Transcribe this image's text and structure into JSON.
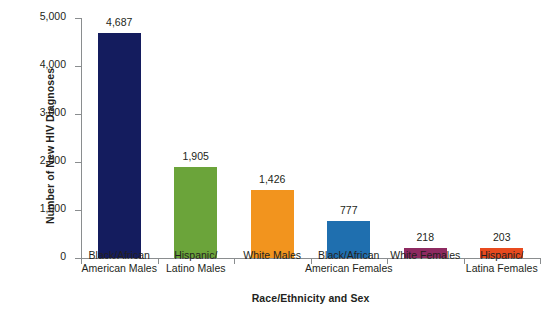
{
  "chart_data": {
    "type": "bar",
    "title": "",
    "xlabel": "Race/Ethnicity and Sex",
    "ylabel": "Number of New HIV Diagnoses",
    "ylim": [
      0,
      5000
    ],
    "yticks": [
      0,
      1000,
      2000,
      3000,
      4000,
      5000
    ],
    "ytick_labels": [
      "0",
      "1,000",
      "2,000",
      "3,000",
      "4,000",
      "5,000"
    ],
    "grid": false,
    "legend": "none",
    "categories": [
      "Black/African\nAmerican Males",
      "Hispanic/\nLatino Males",
      "White Males",
      "Black/African\nAmerican Females",
      "White Females",
      "Hispanic/\nLatina Females"
    ],
    "values": [
      4687,
      1905,
      1426,
      777,
      218,
      203
    ],
    "value_labels": [
      "4,687",
      "1,905",
      "1,426",
      "777",
      "218",
      "203"
    ],
    "bar_colors": [
      "#141c5e",
      "#6ba43a",
      "#f2941e",
      "#1f6faf",
      "#8e2a61",
      "#e84a1e"
    ]
  },
  "ghost_text": "",
  "axis": {
    "line_color": "#8a8d8f",
    "text_color": "#231f20"
  }
}
